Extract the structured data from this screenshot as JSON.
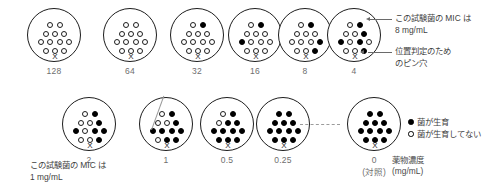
{
  "figure": {
    "legend": {
      "growth_label": "菌が生育",
      "no_growth_label": "菌が生育してない",
      "growth_icon": "filled-circle-icon",
      "no_growth_icon": "open-circle-icon"
    },
    "axis": {
      "concentration_label": "薬物濃度",
      "concentration_unit": "(mg/mL)",
      "control_label": "(対照)"
    },
    "annotations": {
      "top_mic": "この試験菌の MIC は",
      "top_mic_value": "8 mg/mL",
      "pinhole_line1": "位置判定のため",
      "pinhole_line2": "のピン穴",
      "bottom_mic": "この試験菌の MIC は",
      "bottom_mic_value": "1 mg/mL"
    },
    "pinhole_glyph": "X",
    "colors": {
      "outline": "#1d1d1d",
      "filled_well": "#000000",
      "open_well": "#ffffff",
      "label_text": "#6e6e6e",
      "anno_text": "#3f3f3f",
      "leader": "#6a6a6a"
    },
    "well_layout": {
      "rows": [
        2,
        3,
        4,
        3
      ],
      "total_wells": 12
    },
    "plates": [
      {
        "id": "plate-128",
        "label": "128",
        "row": 1,
        "wells": [
          0,
          0,
          0,
          0,
          0,
          0,
          0,
          0,
          0,
          0,
          0,
          0
        ]
      },
      {
        "id": "plate-64",
        "label": "64",
        "row": 1,
        "wells": [
          0,
          0,
          0,
          0,
          0,
          0,
          0,
          0,
          0,
          0,
          0,
          0
        ]
      },
      {
        "id": "plate-32",
        "label": "32",
        "row": 1,
        "wells": [
          0,
          1,
          0,
          0,
          0,
          0,
          0,
          0,
          0,
          0,
          0,
          0
        ]
      },
      {
        "id": "plate-16",
        "label": "16",
        "row": 1,
        "wells": [
          0,
          1,
          0,
          0,
          0,
          1,
          0,
          0,
          0,
          0,
          0,
          0
        ]
      },
      {
        "id": "plate-8",
        "label": "8",
        "row": 1,
        "wells": [
          0,
          1,
          0,
          0,
          0,
          0,
          0,
          0,
          1,
          0,
          0,
          1
        ]
      },
      {
        "id": "plate-4",
        "label": "4",
        "row": 1,
        "wells": [
          0,
          1,
          0,
          0,
          1,
          1,
          0,
          1,
          0,
          0,
          0,
          1
        ]
      },
      {
        "id": "plate-2",
        "label": "2",
        "row": 2,
        "wells": [
          0,
          1,
          0,
          0,
          1,
          1,
          0,
          1,
          1,
          0,
          0,
          1
        ]
      },
      {
        "id": "plate-1",
        "label": "1",
        "row": 2,
        "wells": [
          0,
          1,
          0,
          0,
          1,
          1,
          1,
          1,
          1,
          0,
          1,
          1
        ]
      },
      {
        "id": "plate-05",
        "label": "0.5",
        "row": 2,
        "wells": [
          0,
          1,
          0,
          1,
          1,
          1,
          1,
          1,
          1,
          1,
          1,
          1
        ]
      },
      {
        "id": "plate-025",
        "label": "0.25",
        "row": 2,
        "wells": [
          1,
          1,
          1,
          1,
          1,
          1,
          1,
          1,
          1,
          1,
          1,
          1
        ]
      },
      {
        "id": "plate-0",
        "label": "0",
        "row": 2,
        "wells": [
          1,
          1,
          1,
          1,
          1,
          1,
          1,
          1,
          1,
          1,
          1,
          1
        ]
      }
    ]
  }
}
